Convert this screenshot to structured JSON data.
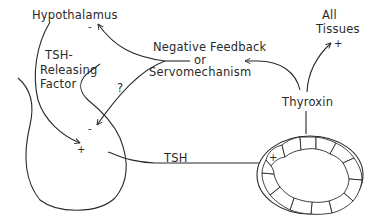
{
  "diagram": {
    "labels": {
      "hypothalamus": "Hypothalamus",
      "trf_line1": "TSH-",
      "trf_line2": "Releasing",
      "trf_line3": "Factor",
      "feedback_line1": "Negative Feedback",
      "feedback_line2": "or",
      "feedback_line3": "Servomechanism",
      "all_tissues_line1": "All",
      "all_tissues_line2": "Tissues",
      "thyroxin": "Thyroxin",
      "tsh": "TSH",
      "question": "?"
    },
    "signs": {
      "hypothalamus_inhibit": "-",
      "pituitary_inhibit": "-",
      "pituitary_stimulate": "+",
      "tissues_stimulate": "+",
      "thyroid_stimulate": "+"
    },
    "colors": {
      "ink": "#2a2a2a",
      "background": "#ffffff"
    }
  }
}
